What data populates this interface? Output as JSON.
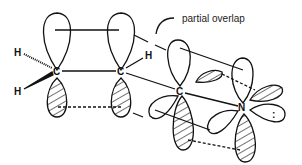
{
  "diagram": {
    "caption": "partial overlap",
    "atoms": {
      "c1": "C",
      "c2": "C",
      "c3": "C",
      "n": "N",
      "h1": "H",
      "h2": "H",
      "h3": "H"
    },
    "lone_pair_symbol": ":",
    "colors": {
      "stroke": "#111111",
      "background": "#ffffff"
    }
  }
}
